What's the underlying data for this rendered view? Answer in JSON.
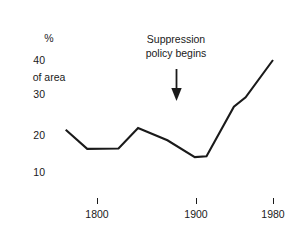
{
  "chart_data": {
    "type": "line",
    "title": "",
    "xlabel": "",
    "ylabel": "% of area",
    "ylabel_lines": [
      "%",
      "of area"
    ],
    "xlim": [
      1765,
      1985
    ],
    "ylim": [
      0,
      45
    ],
    "grid": false,
    "legend": null,
    "ytick_labels": [
      "40",
      "30",
      "20",
      "10"
    ],
    "ytick_values": [
      40,
      30,
      20,
      10
    ],
    "xtick_labels": [
      "1800",
      "1900",
      "1980"
    ],
    "xtick_values": [
      1800,
      1900,
      1980
    ],
    "series": [
      {
        "name": "% of area burned",
        "x": [
          1768,
          1790,
          1822,
          1842,
          1872,
          1900,
          1912,
          1940,
          1952,
          1980
        ],
        "values": [
          21.3,
          16.2,
          16.3,
          21.8,
          18.5,
          14.0,
          14.2,
          27.5,
          30.0,
          40.0
        ]
      }
    ],
    "annotations": [
      {
        "text": "Suppression policy begins",
        "lines": [
          "Suppression",
          "policy begins"
        ],
        "x": 1900,
        "arrow": "down"
      }
    ],
    "colors": {
      "line": "#1a1a1a",
      "text": "#1a1a1a",
      "background": "#ffffff"
    }
  }
}
